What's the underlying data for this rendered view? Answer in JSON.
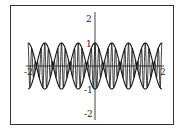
{
  "chart_data": {
    "type": "line",
    "title": "",
    "xlabel": "",
    "ylabel": "",
    "xlim": [
      -2,
      2
    ],
    "ylim": [
      -2.2,
      2.2
    ],
    "x_ticks": [
      "-2",
      "2"
    ],
    "y_ticks": [
      "2",
      "1",
      "-1",
      "-2"
    ],
    "grid": false,
    "legend": null,
    "series": [
      {
        "name": "envelope upper",
        "expr": "|cos(2*pi*x)| lobes, amplitude 1, 8 lobes across [-2,2]"
      },
      {
        "name": "envelope lower",
        "expr": "-(upper envelope)"
      },
      {
        "name": "carrier",
        "expr": "fast oscillation modulated by envelope"
      }
    ],
    "colors": {
      "line": "#111111",
      "frame": "#333333",
      "axis": "#444444"
    }
  }
}
